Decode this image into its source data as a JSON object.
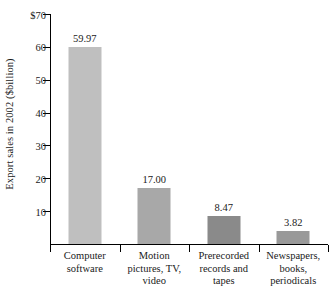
{
  "chart_data": {
    "type": "bar",
    "title": "",
    "xlabel": "",
    "ylabel": "Export sales in 2002 ($billion)",
    "ylim": [
      0,
      70
    ],
    "grid": false,
    "legend": null,
    "y_ticks": [
      {
        "value": 70,
        "label": "$70"
      },
      {
        "value": 60,
        "label": "60"
      },
      {
        "value": 50,
        "label": "50"
      },
      {
        "value": 40,
        "label": "40"
      },
      {
        "value": 30,
        "label": "30"
      },
      {
        "value": 20,
        "label": "20"
      },
      {
        "value": 10,
        "label": "10"
      }
    ],
    "categories": [
      "Computer software",
      "Motion pictures, TV, video",
      "Prerecorded records and tapes",
      "Newspapers, books, periodicals"
    ],
    "category_lines": [
      [
        "Computer",
        "software"
      ],
      [
        "Motion",
        "pictures, TV,",
        "video"
      ],
      [
        "Prerecorded",
        "records and",
        "tapes"
      ],
      [
        "Newspapers,",
        "books,",
        "periodicals"
      ]
    ],
    "values": [
      59.97,
      17.0,
      8.47,
      3.82
    ],
    "value_labels": [
      "59.97",
      "17.00",
      "8.47",
      "3.82"
    ],
    "bar_colors": [
      "#bfbfbf",
      "#a8a8a8",
      "#8a8a8a",
      "#999999"
    ],
    "axis_color": "#000000"
  }
}
